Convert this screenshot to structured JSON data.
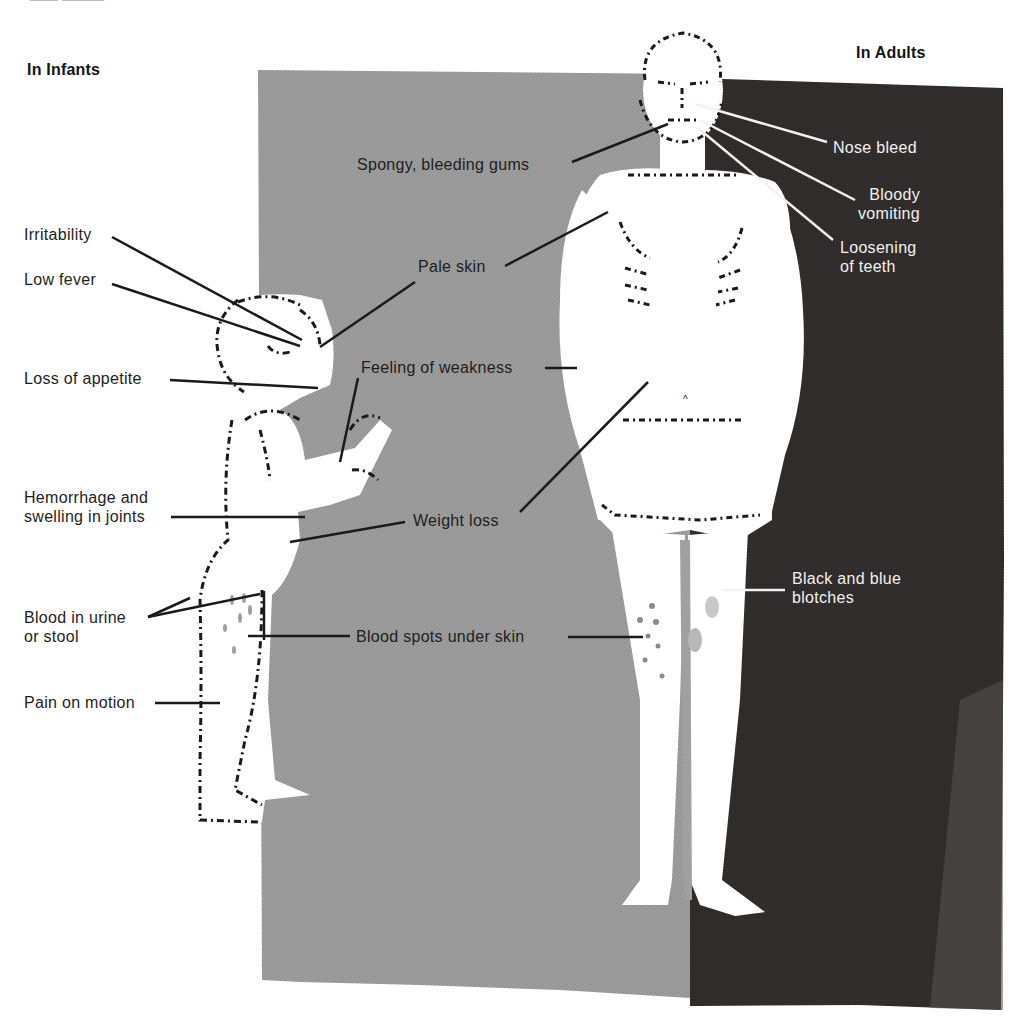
{
  "colors": {
    "background": "#ffffff",
    "grey_panel": "#9c9c9c",
    "dark_panel": "#2e2a29",
    "ink": "#1c1c1c",
    "figure": "#ffffff",
    "light_text": "#f2f2f2"
  },
  "headings": {
    "infants": "In Infants",
    "adults": "In Adults"
  },
  "infant_labels": [
    {
      "id": "irritability",
      "text": "Irritability"
    },
    {
      "id": "low-fever",
      "text": "Low fever"
    },
    {
      "id": "loss-of-appetite",
      "text": "Loss of appetite"
    },
    {
      "id": "hemorrhage-joints",
      "text": "Hemorrhage and\nswelling in joints"
    },
    {
      "id": "blood-urine-stool",
      "text": "Blood in urine\nor stool"
    },
    {
      "id": "pain-on-motion",
      "text": "Pain on motion"
    }
  ],
  "shared_labels": [
    {
      "id": "spongy-gums",
      "text": "Spongy, bleeding gums"
    },
    {
      "id": "pale-skin",
      "text": "Pale skin"
    },
    {
      "id": "feeling-weakness",
      "text": "Feeling of weakness"
    },
    {
      "id": "weight-loss",
      "text": "Weight loss"
    },
    {
      "id": "blood-spots",
      "text": "Blood spots under skin"
    }
  ],
  "adult_labels": [
    {
      "id": "nose-bleed",
      "text": "Nose bleed"
    },
    {
      "id": "bloody-vomiting",
      "text": "Bloody\nvomiting"
    },
    {
      "id": "loosening-teeth",
      "text": "Loosening\nof teeth"
    },
    {
      "id": "black-blue-blotches",
      "text": "Black and blue\nblotches"
    }
  ]
}
